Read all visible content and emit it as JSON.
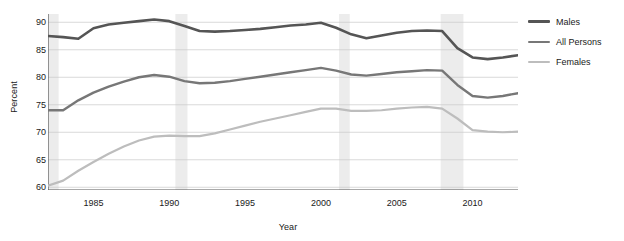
{
  "chart_data": {
    "type": "line",
    "title": "",
    "xlabel": "Year",
    "ylabel": "Percent",
    "xlim": [
      1982,
      2013
    ],
    "ylim": [
      59.5,
      91.5
    ],
    "grid": true,
    "legend_position": "right",
    "x_ticks": [
      "1985",
      "1990",
      "1995",
      "2000",
      "2005",
      "2010"
    ],
    "x_tick_values": [
      1985,
      1990,
      1995,
      2000,
      2005,
      2010
    ],
    "y_ticks": [
      "60",
      "65",
      "70",
      "75",
      "80",
      "85",
      "90"
    ],
    "y_tick_values": [
      60,
      65,
      70,
      75,
      80,
      85,
      90
    ],
    "x": [
      1982,
      1983,
      1984,
      1985,
      1986,
      1987,
      1988,
      1989,
      1990,
      1991,
      1992,
      1993,
      1994,
      1995,
      1996,
      1997,
      1998,
      1999,
      2000,
      2001,
      2002,
      2003,
      2004,
      2005,
      2006,
      2007,
      2008,
      2009,
      2010,
      2011,
      2012,
      2013
    ],
    "series": [
      {
        "name": "Males",
        "color": "#555555",
        "width": 2.6,
        "values": [
          87.5,
          87.3,
          87.0,
          88.9,
          89.6,
          89.9,
          90.2,
          90.5,
          90.2,
          89.3,
          88.4,
          88.3,
          88.4,
          88.6,
          88.8,
          89.1,
          89.4,
          89.6,
          89.9,
          89.0,
          87.8,
          87.1,
          87.6,
          88.1,
          88.4,
          88.5,
          88.4,
          85.3,
          83.6,
          83.3,
          83.6,
          84.0
        ]
      },
      {
        "name": "All Persons",
        "color": "#777777",
        "width": 2.4,
        "values": [
          74.0,
          74.0,
          75.8,
          77.2,
          78.3,
          79.2,
          80.0,
          80.4,
          80.1,
          79.3,
          78.9,
          79.0,
          79.3,
          79.7,
          80.1,
          80.5,
          80.9,
          81.3,
          81.7,
          81.2,
          80.5,
          80.3,
          80.6,
          80.9,
          81.1,
          81.3,
          81.2,
          78.6,
          76.6,
          76.3,
          76.6,
          77.1
        ]
      },
      {
        "name": "Females",
        "color": "#bdbdbd",
        "width": 2.2,
        "values": [
          60.3,
          61.2,
          63.0,
          64.6,
          66.1,
          67.4,
          68.5,
          69.2,
          69.4,
          69.3,
          69.3,
          69.8,
          70.5,
          71.2,
          71.9,
          72.5,
          73.1,
          73.7,
          74.3,
          74.3,
          73.9,
          73.9,
          74.0,
          74.3,
          74.5,
          74.6,
          74.3,
          72.5,
          70.4,
          70.1,
          70.0,
          70.1
        ]
      }
    ],
    "shaded_bands": [
      {
        "name": "recession-1982",
        "start": 1982.0,
        "end": 1982.7
      },
      {
        "name": "recession-1990",
        "start": 1990.4,
        "end": 1991.2
      },
      {
        "name": "recession-2001",
        "start": 2001.2,
        "end": 2001.9
      },
      {
        "name": "recession-2008",
        "start": 2007.9,
        "end": 2009.4
      }
    ],
    "band_color": "#ececec"
  },
  "legend": {
    "items": [
      {
        "label": "Males"
      },
      {
        "label": "All Persons"
      },
      {
        "label": "Females"
      }
    ]
  }
}
